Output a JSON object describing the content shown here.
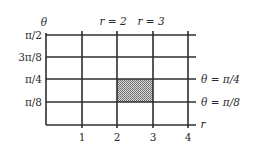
{
  "diagram": {
    "type": "polar-rectangle-grid",
    "axes": {
      "vertical_label": "θ",
      "horizontal_label": "r"
    },
    "theta_ticks": [
      {
        "label": "π/2",
        "y": 35
      },
      {
        "label": "3π/8",
        "y": 57
      },
      {
        "label": "π/4",
        "y": 79
      },
      {
        "label": "π/8",
        "y": 102
      }
    ],
    "r_ticks": [
      {
        "label": "1",
        "x": 82
      },
      {
        "label": "2",
        "x": 117
      },
      {
        "label": "3",
        "x": 153
      },
      {
        "label": "4",
        "x": 188
      }
    ],
    "top_labels": [
      {
        "text": "r = 2",
        "x": 108
      },
      {
        "text": "r = 3",
        "x": 147
      }
    ],
    "right_labels": [
      {
        "text": "θ = π/4",
        "y": 79
      },
      {
        "text": "θ = π/8",
        "y": 102
      }
    ],
    "shaded_region": {
      "r_range": [
        2,
        3
      ],
      "theta_range": [
        "π/8",
        "π/4"
      ],
      "fill": "#9a9a9a"
    },
    "colors": {
      "line": "#2e2e2e",
      "text": "#2a2a2a"
    }
  }
}
